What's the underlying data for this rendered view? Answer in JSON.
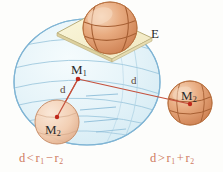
{
  "figure": {
    "background_color": "#fdfdfb",
    "width": 223,
    "height": 172
  },
  "labels": {
    "plane": "E",
    "big_center": "M",
    "big_center_sub": "1",
    "inner_small": "M",
    "inner_small_sub": "2",
    "outer_small": "M",
    "outer_small_sub": "2",
    "distance_left": "d",
    "distance_right": "d"
  },
  "captions": {
    "left": {
      "d": "d",
      "relation": "<",
      "r1": "r",
      "r1_sub": "1",
      "operator": "−",
      "r2": "r",
      "r2_sub": "2",
      "full_text": "d < r1 − r2"
    },
    "right": {
      "d": "d",
      "relation": ">",
      "r1": "r",
      "r1_sub": "1",
      "operator": "+",
      "r2": "r",
      "r2_sub": "2",
      "full_text": "d > r1 + r2"
    }
  },
  "colors": {
    "big_sphere_fill": "#daeef7",
    "big_sphere_stroke": "#7fb4d4",
    "plane_fill": "#f7f1cf",
    "plane_stroke": "#b9ad7a",
    "ball_orange": "#e09a6e",
    "ball_orange_light": "#f0c6a4",
    "inner_ball_fill": "#f4cfb4",
    "inner_ball_stroke": "#c98f6a",
    "line_red": "#c4503c",
    "dot_red": "#c0281c",
    "caption_red": "#cf7a62",
    "text_dark": "#2a2a2a"
  },
  "geometry": {
    "big_sphere": {
      "cx": 87,
      "cy": 82,
      "rx": 73,
      "ry": 63
    },
    "inner_ball": {
      "cx": 57,
      "cy": 122,
      "r": 22
    },
    "outer_ball": {
      "cx": 190,
      "cy": 103,
      "r": 22
    },
    "top_ball": {
      "cx": 110,
      "cy": 28,
      "rx": 27,
      "ry": 26
    },
    "m1_point": {
      "x": 78,
      "y": 79
    },
    "m2_inner_point": {
      "x": 57,
      "y": 117
    },
    "m2_outer_point": {
      "x": 190,
      "y": 104
    }
  }
}
